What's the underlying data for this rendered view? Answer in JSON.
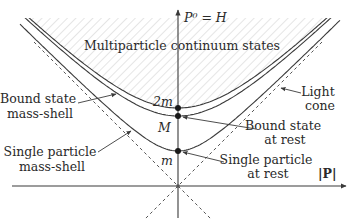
{
  "diagram": {
    "axes": {
      "vertical_label": "P⁰ = H",
      "horizontal_label": "|P|"
    },
    "regions": {
      "continuum_label": "Multiparticle continuum states"
    },
    "levels": {
      "two_m": "2m",
      "bound_mass": "M",
      "single_mass": "m"
    },
    "annotations": {
      "bound_state_mass_shell": [
        "Bound state",
        "mass-shell"
      ],
      "single_particle_mass_shell": [
        "Single particle",
        "mass-shell"
      ],
      "light_cone": [
        "Light",
        "cone"
      ],
      "bound_state_at_rest": [
        "Bound state",
        "at rest"
      ],
      "single_particle_at_rest": [
        "Single particle",
        "at rest"
      ]
    },
    "colors": {
      "line": "#3a3a3a",
      "hatch": "#c8c8c8",
      "text": "#2a2a2a"
    }
  }
}
